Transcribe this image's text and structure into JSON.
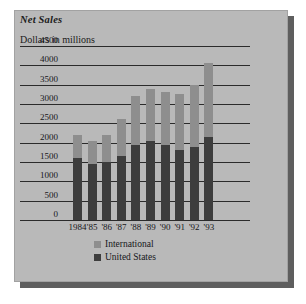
{
  "chart_data": {
    "type": "bar",
    "stacked": true,
    "title": "Net Sales",
    "subtitle": "Dollars in millions",
    "xlabel": "",
    "ylabel": "Dollars in millions",
    "ylim": [
      0,
      4500
    ],
    "ytick_values": [
      4500,
      4000,
      3500,
      3000,
      2500,
      2000,
      1500,
      1000,
      500,
      0
    ],
    "ytick_labels": [
      "4500",
      "4000",
      "3500",
      "3000",
      "2500",
      "2000",
      "1500",
      "1000",
      "500",
      "0"
    ],
    "grid": true,
    "legend_position": "bottom",
    "categories": [
      "1984",
      "'85",
      "'86",
      "'87",
      "'88",
      "'89",
      "'90",
      "'91",
      "'92",
      "'93"
    ],
    "series": [
      {
        "name": "United States",
        "color": "#3d3d3d",
        "values": [
          1600,
          1450,
          1500,
          1650,
          1950,
          2050,
          1950,
          1800,
          1900,
          2150
        ]
      },
      {
        "name": "International",
        "color": "#8e8e8e",
        "values": [
          600,
          600,
          700,
          950,
          1250,
          1350,
          1350,
          1450,
          1600,
          1900
        ]
      }
    ],
    "totals": [
      2200,
      2050,
      2200,
      2600,
      3200,
      3400,
      3300,
      3250,
      3500,
      4050
    ]
  },
  "legend": {
    "items": [
      {
        "label": "International",
        "color": "#8e8e8e"
      },
      {
        "label": "United States",
        "color": "#3d3d3d"
      }
    ]
  },
  "colors": {
    "card_background": "#b9b9b9",
    "card_shadow": "#5e5e5e",
    "page_background": "#ffffff",
    "gridline": "#2b2b2b",
    "text": "#17171a"
  }
}
